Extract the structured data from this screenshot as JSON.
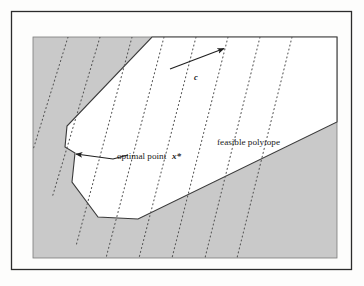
{
  "figure": {
    "type": "diagram",
    "paper_background": "#fdfdfc",
    "frame": {
      "border_color": "#2b2b2b",
      "x": 11,
      "y": 11,
      "width": 341,
      "height": 259
    },
    "shaded_region": {
      "name": "infeasible-shaded-background",
      "fill": "#c9c9c9",
      "stroke": "#6f6f6f",
      "x": 33,
      "y": 37,
      "width": 304,
      "height": 221
    },
    "polytope": {
      "name": "feasible-polytope",
      "fill": "#ffffff",
      "stroke": "#3a3a3a",
      "vertices": [
        [
          152,
          37
        ],
        [
          337,
          37
        ],
        [
          337,
          122
        ],
        [
          138,
          219
        ],
        [
          98,
          217
        ],
        [
          72,
          182
        ],
        [
          75,
          153
        ],
        [
          65,
          147
        ],
        [
          67,
          126
        ]
      ]
    },
    "objective_lines": {
      "name": "objective-level-lines",
      "style": "dotted",
      "color": "#555555",
      "count": 8,
      "slope_description": "lines descend toward lower-left; normal direction is c",
      "segments": [
        [
          [
            68,
            37
          ],
          [
            33,
            150
          ]
        ],
        [
          [
            100,
            37
          ],
          [
            52,
            198
          ]
        ],
        [
          [
            132,
            37
          ],
          [
            76,
            246
          ]
        ],
        [
          [
            164,
            37
          ],
          [
            106,
            258
          ]
        ],
        [
          [
            196,
            37
          ],
          [
            139,
            258
          ]
        ],
        [
          [
            228,
            37
          ],
          [
            172,
            258
          ]
        ],
        [
          [
            260,
            37
          ],
          [
            205,
            258
          ]
        ],
        [
          [
            292,
            37
          ],
          [
            237,
            258
          ]
        ]
      ]
    },
    "gradient_arrow": {
      "name": "objective-gradient-vector",
      "label": "c",
      "from": [
        170,
        69
      ],
      "to": [
        227,
        47
      ],
      "label_pos": [
        196,
        80
      ],
      "color": "#1f1f1f"
    },
    "optimal_point": {
      "name": "optimal-point-marker",
      "label_text": "optimal point",
      "label_symbol": "x*",
      "vertex": [
        66,
        147
      ],
      "leader_from": [
        113,
        159
      ],
      "leader_to": [
        72,
        153
      ],
      "label_pos": [
        117,
        161
      ],
      "symbol_pos": [
        172,
        161
      ]
    },
    "feasible_label": {
      "name": "feasible-polytope-label",
      "text": "feasible polytope",
      "pos": [
        217,
        145
      ]
    },
    "show_through_text": {
      "name": "page-show-through-text",
      "description": "faint mirrored text bleeding from the reverse side of the printed page",
      "lines": [
        {
          "text": "OPTIMALITY AND DUALITY",
          "x": 200,
          "y": 202,
          "size": 12
        },
        {
          "text": "PROBLEMS",
          "x": 206,
          "y": 229,
          "size": 10
        }
      ]
    }
  }
}
